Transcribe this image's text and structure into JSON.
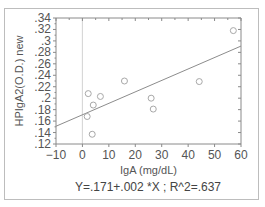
{
  "chart_data": {
    "type": "scatter",
    "title": "",
    "xlabel": "IgA (mg/dL)",
    "ylabel": "HPIgA2(O.D.) new",
    "xlim": [
      -10,
      60
    ],
    "ylim": [
      0.12,
      0.34
    ],
    "x_ticks": [
      -10,
      0,
      10,
      20,
      30,
      40,
      50,
      60
    ],
    "x_tick_labels": [
      "−10",
      "0",
      "10",
      "20",
      "30",
      "40",
      "50",
      "60"
    ],
    "y_ticks": [
      0.12,
      0.14,
      0.16,
      0.18,
      0.2,
      0.22,
      0.24,
      0.26,
      0.28,
      0.3,
      0.32,
      0.34
    ],
    "y_tick_labels": [
      ".12",
      ".14",
      ".16",
      ".18",
      ".2",
      ".22",
      ".24",
      ".26",
      ".28",
      ".3",
      ".32",
      ".34"
    ],
    "grid": false,
    "reference_line_x": 0,
    "series": [
      {
        "name": "observations",
        "marker": "open-circle",
        "points": [
          {
            "x": 2.2,
            "y": 0.208
          },
          {
            "x": 6.8,
            "y": 0.203
          },
          {
            "x": 4.1,
            "y": 0.188
          },
          {
            "x": 1.8,
            "y": 0.168
          },
          {
            "x": 3.7,
            "y": 0.137
          },
          {
            "x": 15.9,
            "y": 0.23
          },
          {
            "x": 26.0,
            "y": 0.2
          },
          {
            "x": 26.8,
            "y": 0.181
          },
          {
            "x": 44.2,
            "y": 0.229
          },
          {
            "x": 57.1,
            "y": 0.318
          }
        ]
      }
    ],
    "fit_line": {
      "intercept": 0.171,
      "slope": 0.002,
      "r_squared": 0.637
    },
    "annotation": "Y=.171+.002 *X ; R^2=.637"
  },
  "labels": {
    "xlabel": "IgA (mg/dL)",
    "ylabel": "HPIgA2(O.D.) new",
    "equation": "Y=.171+.002 *X ; R^2=.637"
  },
  "colors": {
    "axis": "#8a8a8a",
    "marker": "#a8a8a8",
    "fit_line": "#8c8c8c",
    "reference_line": "#d8d8d8"
  }
}
